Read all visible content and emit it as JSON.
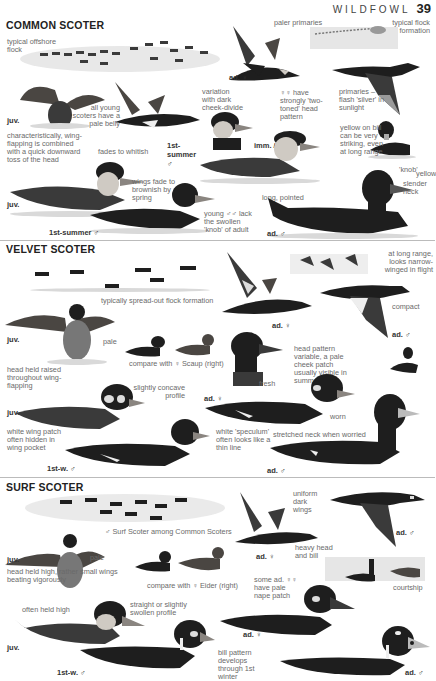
{
  "header": {
    "chapter": "WILDFOWL",
    "page_number": "39"
  },
  "sections": [
    {
      "title": "COMMON SCOTER",
      "labels": {
        "flock_offshore": "typical offshore flock",
        "paler_primaries": "paler primaries",
        "flock_formation": "typical flock formation",
        "ad_female_flight": "ad. ♀",
        "variation_cheek": "variation with dark cheek-divide",
        "two_toned": "♀♀ have strongly 'two-toned' head pattern",
        "primaries_flash": "primaries – flash 'silver' in sunlight",
        "juv_flap": "juv.",
        "pale_belly": "all young scoters have a pale belly",
        "wing_flapping": "characteristically, wing-flapping is combined with a quick downward toss of the head",
        "fades_whitish": "fades to whitish",
        "first_summer_flight": "1st-summer ♂",
        "imm_female": "imm. / ♀",
        "yellow_bill": "yellow on bill can be very striking, even at long range",
        "knob": "'knob'",
        "yellow": "yellow",
        "juv_swim": "juv.",
        "wings_fade": "wings fade to brownish by spring",
        "long_pointed": "long, pointed",
        "slender_neck": "slender neck",
        "first_summer_swim": "1st-summer ♂",
        "young_males": "young ♂♂ lack the swollen 'knob' of adult",
        "ad_male": "ad. ♂"
      }
    },
    {
      "title": "VELVET SCOTER",
      "labels": {
        "spread_flock": "typically spread-out flock formation",
        "long_range": "at long range, looks narrow-winged in flight",
        "ad_female_flight": "ad. ♀",
        "compact": "compact",
        "ad_male_flight": "ad. ♂",
        "juv_flap": "juv.",
        "pale": "pale",
        "compare_scaup": "compare with ♀ Scaup (right)",
        "head_raised": "head held raised throughout wing-flapping",
        "head_pattern": "head pattern variable, a pale cheek patch usually visible in summer",
        "concave": "slightly concave profile",
        "ad_female_swim": "ad. ♀",
        "fresh": "fresh",
        "worn": "worn",
        "juv_swim": "juv.",
        "white_patch": "white wing patch often hidden in wing pocket",
        "speculum": "white 'speculum' often looks like a thin line",
        "stretched_neck": "stretched neck when worried",
        "first_winter": "1st-w. ♂",
        "ad_male_swim": "ad. ♂"
      }
    },
    {
      "title": "SURF SCOTER",
      "labels": {
        "among_common": "♂ Surf Scoter among Common Scoters",
        "uniform_wings": "uniform dark wings",
        "ad_female_flight": "ad. ♀",
        "heavy_head": "heavy head and bill",
        "ad_male_flight": "ad. ♂",
        "juv_flap": "juv.",
        "pale": "pale",
        "head_held": "head held high, rather small wings beating vigorously",
        "compare_eider": "compare with ♀ Eider (right)",
        "some_females": "some ad. ♀♀ have pale nape patch",
        "courtship": "courtship",
        "often_high": "often held high",
        "straight_profile": "straight or slightly swollen profile",
        "ad_female_swim": "ad. ♀",
        "juv_swim": "juv.",
        "bill_pattern": "bill pattern develops through 1st winter",
        "first_winter": "1st-w. ♂",
        "ad_male_swim": "ad. ♂"
      }
    }
  ]
}
